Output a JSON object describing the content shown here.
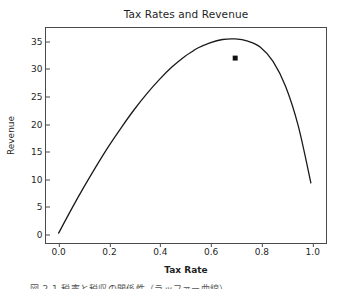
{
  "chart_data": {
    "type": "line",
    "title": "Tax Rates and Revenue",
    "xlabel": "Tax Rate",
    "ylabel": "Revenue",
    "xlim": [
      -0.05,
      1.06
    ],
    "ylim": [
      -1.8,
      37.5
    ],
    "grid": false,
    "legend": null,
    "line_color": "#1a1a1a",
    "marker_color": "#111111",
    "xticks": [
      0.0,
      0.2,
      0.4,
      0.6,
      0.8,
      1.0
    ],
    "xticklabels": [
      "0.0",
      "0.2",
      "0.4",
      "0.6",
      "0.8",
      "1.0"
    ],
    "yticks": [
      0,
      5,
      10,
      15,
      20,
      25,
      30,
      35
    ],
    "yticklabels": [
      "0",
      "5",
      "10",
      "15",
      "20",
      "25",
      "30",
      "35"
    ],
    "series": [
      {
        "name": "Laffer curve",
        "x": [
          0.0,
          0.05,
          0.1,
          0.15,
          0.2,
          0.25,
          0.3,
          0.35,
          0.4,
          0.45,
          0.5,
          0.53,
          0.55,
          0.6,
          0.65,
          0.7,
          0.75,
          0.8,
          0.85,
          0.9,
          0.95,
          1.0
        ],
        "y": [
          0.0,
          4.3,
          8.4,
          12.3,
          16.0,
          19.4,
          22.6,
          25.5,
          28.1,
          30.4,
          32.3,
          33.2,
          33.8,
          34.8,
          35.4,
          35.5,
          35.1,
          34.0,
          31.4,
          26.8,
          19.6,
          9.2
        ]
      }
    ],
    "markers": [
      {
        "name": "operating-point",
        "x": 0.7,
        "y": 32.0,
        "shape": "square"
      }
    ]
  },
  "caption": {
    "text": "図 2-1  税率と税収の関係性（ラッファー曲線）"
  }
}
